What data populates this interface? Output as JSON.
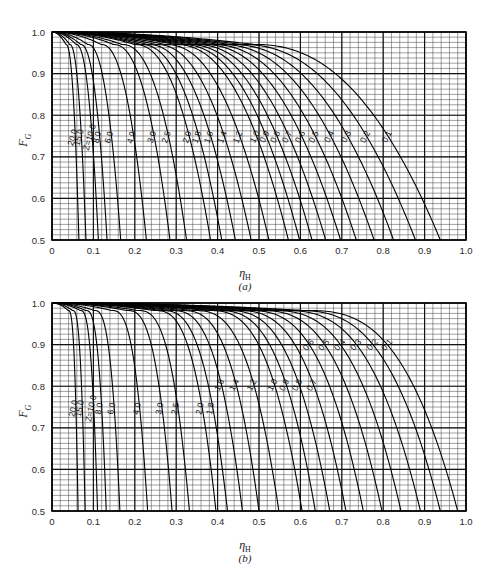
{
  "page": {
    "header_text": ""
  },
  "chart_data": [
    {
      "type": "line",
      "panel": "a",
      "panel_caption": "(a)",
      "title": "",
      "xlabel": "η",
      "xlabel_sub": "H",
      "ylabel": "F",
      "ylabel_sub": "G",
      "xlim": [
        0,
        1.0
      ],
      "ylim": [
        0.5,
        1.0
      ],
      "xticks": [
        "0",
        "0.1",
        "0.2",
        "0.3",
        "0.4",
        "0.5",
        "0.6",
        "0.7",
        "0.8",
        "0.9",
        "1.0"
      ],
      "xtick_values": [
        0,
        0.1,
        0.2,
        0.3,
        0.4,
        0.5,
        0.6,
        0.7,
        0.8,
        0.9,
        1.0
      ],
      "yticks": [
        "0.5",
        "0.6",
        "0.7",
        "0.8",
        "0.9",
        "1.0"
      ],
      "ytick_values": [
        0.5,
        0.6,
        0.7,
        0.8,
        0.9,
        1.0
      ],
      "grid": true,
      "grid_minor_x": 0.02,
      "grid_minor_y": 0.0125,
      "legend": "inline-curve-labels",
      "parameter_symbol": "Z",
      "parameter_annotation": "Z=10.0",
      "series": [
        {
          "name": "20.0",
          "label": "20.0",
          "Z": 20.0,
          "x_end": 0.065
        },
        {
          "name": "15.0",
          "label": "15.0",
          "Z": 15.0,
          "x_end": 0.082
        },
        {
          "name": "10.0",
          "label": "Z=10.0",
          "Z": 10.0,
          "x_end": 0.112
        },
        {
          "name": "8.0",
          "label": "8.0",
          "Z": 8.0,
          "x_end": 0.133
        },
        {
          "name": "6.0",
          "label": "6.0",
          "Z": 6.0,
          "x_end": 0.166
        },
        {
          "name": "4.0",
          "label": "4.0",
          "Z": 4.0,
          "x_end": 0.228
        },
        {
          "name": "3.0",
          "label": "3.0",
          "Z": 3.0,
          "x_end": 0.285
        },
        {
          "name": "2.5",
          "label": "2.5",
          "Z": 2.5,
          "x_end": 0.325
        },
        {
          "name": "2.0",
          "label": "2.0",
          "Z": 2.0,
          "x_end": 0.383
        },
        {
          "name": "1.8",
          "label": "1.8",
          "Z": 1.8,
          "x_end": 0.41
        },
        {
          "name": "1.6",
          "label": "1.6",
          "Z": 1.6,
          "x_end": 0.443
        },
        {
          "name": "1.4",
          "label": "1.4",
          "Z": 1.4,
          "x_end": 0.481
        },
        {
          "name": "1.2",
          "label": "1.2",
          "Z": 1.2,
          "x_end": 0.524
        },
        {
          "name": "1.0",
          "label": "1.0",
          "Z": 1.0,
          "x_end": 0.571
        },
        {
          "name": "0.9",
          "label": "0.9",
          "Z": 0.9,
          "x_end": 0.598
        },
        {
          "name": "0.8",
          "label": "0.8",
          "Z": 0.8,
          "x_end": 0.628
        },
        {
          "name": "0.7",
          "label": "0.7",
          "Z": 0.7,
          "x_end": 0.661
        },
        {
          "name": "0.6",
          "label": "0.6",
          "Z": 0.6,
          "x_end": 0.697
        },
        {
          "name": "0.5",
          "label": "0.5",
          "Z": 0.5,
          "x_end": 0.735
        },
        {
          "name": "0.4",
          "label": "0.4",
          "Z": 0.4,
          "x_end": 0.778
        },
        {
          "name": "0.3",
          "label": "0.3",
          "Z": 0.3,
          "x_end": 0.825
        },
        {
          "name": "0.2",
          "label": "0.2",
          "Z": 0.2,
          "x_end": 0.878
        },
        {
          "name": "0.1",
          "label": "0.1",
          "Z": 0.1,
          "x_end": 0.938
        }
      ]
    },
    {
      "type": "line",
      "panel": "b",
      "panel_caption": "(b)",
      "title": "",
      "xlabel": "η",
      "xlabel_sub": "H",
      "ylabel": "F",
      "ylabel_sub": "G",
      "xlim": [
        0,
        1.0
      ],
      "ylim": [
        0.5,
        1.0
      ],
      "xticks": [
        "0",
        "0.1",
        "0.2",
        "0.3",
        "0.4",
        "0.5",
        "0.6",
        "0.7",
        "0.8",
        "0.9",
        "1.0"
      ],
      "xtick_values": [
        0,
        0.1,
        0.2,
        0.3,
        0.4,
        0.5,
        0.6,
        0.7,
        0.8,
        0.9,
        1.0
      ],
      "yticks": [
        "0.5",
        "0.6",
        "0.7",
        "0.8",
        "0.9",
        "1.0"
      ],
      "ytick_values": [
        0.5,
        0.6,
        0.7,
        0.8,
        0.9,
        1.0
      ],
      "grid": true,
      "grid_minor_x": 0.02,
      "grid_minor_y": 0.0125,
      "legend": "inline-curve-labels",
      "parameter_symbol": "Z",
      "parameter_annotation": "Z=10.0",
      "series": [
        {
          "name": "20.0",
          "label": "20.0",
          "Z": 20.0,
          "x_end": 0.063
        },
        {
          "name": "15.0",
          "label": "15.0",
          "Z": 15.0,
          "x_end": 0.08
        },
        {
          "name": "10.0",
          "label": "Z=10.0",
          "Z": 10.0,
          "x_end": 0.11
        },
        {
          "name": "8.0",
          "label": "8.0",
          "Z": 8.0,
          "x_end": 0.131
        },
        {
          "name": "6.0",
          "label": "6.0",
          "Z": 6.0,
          "x_end": 0.164
        },
        {
          "name": "4.0",
          "label": "4.0",
          "Z": 4.0,
          "x_end": 0.231
        },
        {
          "name": "3.0",
          "label": "3.0",
          "Z": 3.0,
          "x_end": 0.29
        },
        {
          "name": "2.5",
          "label": "2.5",
          "Z": 2.5,
          "x_end": 0.332
        },
        {
          "name": "2.0",
          "label": "2.0",
          "Z": 2.0,
          "x_end": 0.396
        },
        {
          "name": "1.8",
          "label": "1.8",
          "Z": 1.8,
          "x_end": 0.424
        },
        {
          "name": "1.6",
          "label": "1.6",
          "Z": 1.6,
          "x_end": 0.46
        },
        {
          "name": "1.4",
          "label": "1.4",
          "Z": 1.4,
          "x_end": 0.5
        },
        {
          "name": "1.2",
          "label": "1.2",
          "Z": 1.2,
          "x_end": 0.548
        },
        {
          "name": "1.0",
          "label": "1.0",
          "Z": 1.0,
          "x_end": 0.604
        },
        {
          "name": "0.9",
          "label": "0.9",
          "Z": 0.9,
          "x_end": 0.636
        },
        {
          "name": "0.8",
          "label": "0.8",
          "Z": 0.8,
          "x_end": 0.671
        },
        {
          "name": "0.7",
          "label": "0.7",
          "Z": 0.7,
          "x_end": 0.71
        },
        {
          "name": "0.6",
          "label": "0.6",
          "Z": 0.6,
          "x_end": 0.752
        },
        {
          "name": "0.5",
          "label": "0.5",
          "Z": 0.5,
          "x_end": 0.797
        },
        {
          "name": "0.4",
          "label": "0.4",
          "Z": 0.4,
          "x_end": 0.843
        },
        {
          "name": "0.3",
          "label": "0.3",
          "Z": 0.3,
          "x_end": 0.89
        },
        {
          "name": "0.2",
          "label": "0.2",
          "Z": 0.2,
          "x_end": 0.938
        },
        {
          "name": "0.1",
          "label": "0.1",
          "Z": 0.1,
          "x_end": 0.98
        }
      ]
    }
  ]
}
